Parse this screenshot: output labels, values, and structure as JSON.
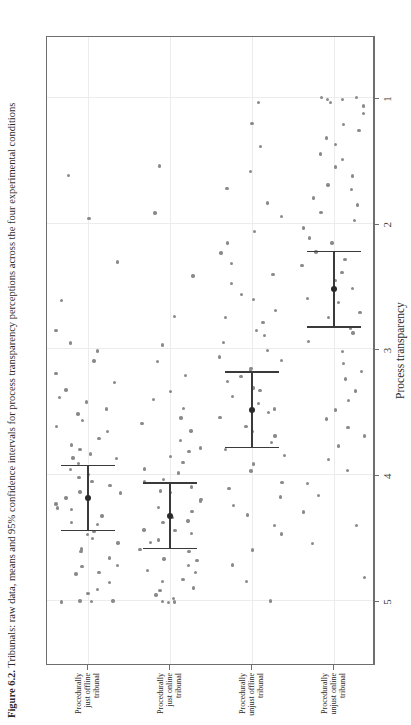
{
  "figure": {
    "caption_number": "Figure 6.2.",
    "caption_text": " Tribunals: raw data, means and 95% confidence intervals for process transparency perceptions across the four experimental conditions"
  },
  "colors": {
    "point": "#8a8a8a",
    "errorbar": "#3a3a3a",
    "mean": "#2a2a2a",
    "grid": "#ececec",
    "panel_border": "#6e6e6e",
    "text": "#2b2b2b",
    "background": "#ffffff"
  },
  "chart_data": {
    "type": "scatter",
    "title": "",
    "xlabel": "Process transparency",
    "ylabel": "",
    "xlim": [
      5.5,
      0.5
    ],
    "xticks": [
      5,
      4,
      3,
      2,
      1
    ],
    "xticklabels": [
      "5",
      "4",
      "3",
      "2",
      "1"
    ],
    "grid": true,
    "legend": "none",
    "orientation": "rotated-90-ccw",
    "categories": [
      "Procedurally just offline tribunal",
      "Procedurally just online tribunal",
      "Procedurally unjust offline tribunal",
      "Procedurally unjust online tribunal"
    ],
    "series": [
      {
        "name": "Mean",
        "values": [
          4.18,
          4.32,
          3.48,
          2.52
        ]
      },
      {
        "name": "CI lower (95%)",
        "values": [
          3.92,
          4.06,
          3.18,
          2.22
        ]
      },
      {
        "name": "CI upper (95%)",
        "values": [
          4.44,
          4.58,
          3.78,
          2.82
        ]
      }
    ],
    "raw_points": {
      "Procedurally just offline tribunal": [
        5.0,
        5.0,
        5.0,
        5.0,
        4.95,
        4.9,
        4.85,
        4.8,
        4.78,
        4.72,
        4.7,
        4.65,
        4.6,
        4.58,
        4.55,
        4.5,
        4.48,
        4.44,
        4.4,
        4.36,
        4.32,
        4.28,
        4.25,
        4.22,
        4.18,
        4.15,
        4.12,
        4.08,
        4.05,
        4.02,
        3.98,
        3.95,
        3.92,
        3.88,
        3.85,
        3.82,
        3.78,
        3.75,
        3.7,
        3.66,
        3.62,
        3.58,
        3.52,
        3.48,
        3.42,
        3.38,
        3.32,
        3.25,
        3.18,
        3.1,
        3.02,
        2.95,
        2.85,
        2.6,
        2.3,
        1.95,
        1.6
      ],
      "Procedurally just online tribunal": [
        5.0,
        5.0,
        5.0,
        4.98,
        4.95,
        4.92,
        4.88,
        4.85,
        4.82,
        4.78,
        4.75,
        4.72,
        4.68,
        4.65,
        4.62,
        4.58,
        4.55,
        4.52,
        4.48,
        4.45,
        4.42,
        4.38,
        4.35,
        4.32,
        4.28,
        4.25,
        4.22,
        4.18,
        4.15,
        4.12,
        4.08,
        4.05,
        4.02,
        3.98,
        3.95,
        3.9,
        3.86,
        3.82,
        3.78,
        3.72,
        3.66,
        3.6,
        3.55,
        3.48,
        3.4,
        3.32,
        3.22,
        3.1,
        2.95,
        2.75,
        2.4,
        1.9,
        1.55
      ],
      "Procedurally unjust offline tribunal": [
        5.0,
        4.85,
        4.7,
        4.58,
        4.48,
        4.4,
        4.32,
        4.25,
        4.18,
        4.12,
        4.05,
        3.98,
        3.92,
        3.86,
        3.8,
        3.75,
        3.7,
        3.65,
        3.6,
        3.55,
        3.5,
        3.46,
        3.42,
        3.38,
        3.34,
        3.3,
        3.26,
        3.22,
        3.18,
        3.14,
        3.1,
        3.05,
        3.0,
        2.95,
        2.9,
        2.85,
        2.8,
        2.74,
        2.68,
        2.62,
        2.55,
        2.48,
        2.4,
        2.32,
        2.24,
        2.15,
        2.05,
        1.95,
        1.85,
        1.72,
        1.58,
        1.4,
        1.2,
        1.05
      ],
      "Procedurally unjust online tribunal": [
        4.8,
        4.55,
        4.4,
        4.28,
        4.15,
        4.05,
        3.95,
        3.86,
        3.78,
        3.7,
        3.62,
        3.55,
        3.48,
        3.4,
        3.32,
        3.25,
        3.18,
        3.1,
        3.02,
        2.95,
        2.88,
        2.82,
        2.76,
        2.7,
        2.64,
        2.58,
        2.52,
        2.46,
        2.4,
        2.34,
        2.28,
        2.22,
        2.16,
        2.1,
        2.04,
        1.98,
        1.92,
        1.86,
        1.8,
        1.74,
        1.68,
        1.62,
        1.56,
        1.5,
        1.44,
        1.38,
        1.32,
        1.26,
        1.2,
        1.14,
        1.08,
        1.04,
        1.02,
        1.0,
        1.0,
        1.0
      ]
    }
  }
}
